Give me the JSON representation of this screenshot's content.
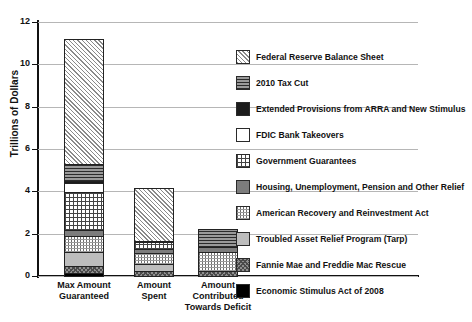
{
  "chart_data": {
    "type": "bar",
    "subtype": "stacked-bar",
    "title": "",
    "xlabel": "",
    "ylabel": "Trillions of Dollars",
    "ylim": [
      0,
      12
    ],
    "yticks": [
      0,
      2,
      4,
      6,
      8,
      10,
      12
    ],
    "ytick_labels": [
      "0",
      "2",
      "4",
      "6",
      "8",
      "10",
      "12"
    ],
    "grid": true,
    "grid_axis": "y",
    "legend_position": "right",
    "categories": [
      "Max Amount Guaranteed",
      "Amount Spent",
      "Amount Contributed Towards Deficit"
    ],
    "category_lines": [
      [
        "Max Amount",
        "Guaranteed"
      ],
      [
        "Amount",
        "Spent"
      ],
      [
        "Amount",
        "Contributed",
        "Towards Deficit"
      ]
    ],
    "totals": [
      11.75,
      4.48,
      2.4
    ],
    "series": [
      {
        "name": "Economic Stimulus Act of 2008",
        "pattern": "solid-black",
        "values": [
          0.17,
          0.0,
          0.0
        ]
      },
      {
        "name": "Fannie Mae and Freddie Mac Rescue",
        "pattern": "checker-grey",
        "values": [
          0.4,
          0.3,
          0.3
        ]
      },
      {
        "name": "Troubled Asset Relief Program (Tarp)",
        "pattern": "solid-light-grey",
        "values": [
          0.7,
          0.38,
          0.0
        ]
      },
      {
        "name": "American Recovery and Reinvestment Act",
        "pattern": "fine-grid-light",
        "values": [
          0.8,
          0.55,
          0.95
        ]
      },
      {
        "name": "Housing, Unemployment, Pension and Other Relief",
        "pattern": "solid-mid-grey",
        "values": [
          0.35,
          0.25,
          0.25
        ]
      },
      {
        "name": "Government Guarantees",
        "pattern": "cross-grid-dark",
        "values": [
          1.85,
          0.35,
          0.0
        ]
      },
      {
        "name": "FDIC Bank Takeovers",
        "pattern": "white",
        "values": [
          0.45,
          0.0,
          0.0
        ]
      },
      {
        "name": "Extended Provisions from ARRA and New Stimulus",
        "pattern": "solid-near-black",
        "values": [
          0.15,
          0.1,
          0.0
        ]
      },
      {
        "name": "2010 Tax Cut",
        "pattern": "horizontal-lines",
        "values": [
          0.85,
          0.0,
          0.9
        ]
      },
      {
        "name": "Federal Reserve Balance Sheet",
        "pattern": "diagonal-hatch",
        "values": [
          5.95,
          2.55,
          0.0
        ]
      }
    ]
  },
  "legend": {
    "items": [
      {
        "label": "Federal Reserve Balance Sheet",
        "swatch": "p-fed"
      },
      {
        "label": "2010 Tax Cut",
        "swatch": "p-tax"
      },
      {
        "label": "Extended Provisions from ARRA and New Stimulus",
        "swatch": "p-ext"
      },
      {
        "label": "FDIC Bank Takeovers",
        "swatch": "p-fdic"
      },
      {
        "label": "Government Guarantees",
        "swatch": "p-guar"
      },
      {
        "label": "Housing, Unemployment, Pension and Other Relief",
        "swatch": "p-house"
      },
      {
        "label": "American Recovery and Reinvestment Act",
        "swatch": "p-arra"
      },
      {
        "label": "Troubled Asset Relief Program (Tarp)",
        "swatch": "p-tarp"
      },
      {
        "label": "Fannie Mae and Freddie Mac Rescue",
        "swatch": "p-fannie"
      },
      {
        "label": "Economic Stimulus Act of 2008",
        "swatch": "p-econ"
      }
    ]
  },
  "colors": {
    "axis": "#111111",
    "grid": "#b6b6b6",
    "background": "#ffffff",
    "text": "#111111"
  }
}
